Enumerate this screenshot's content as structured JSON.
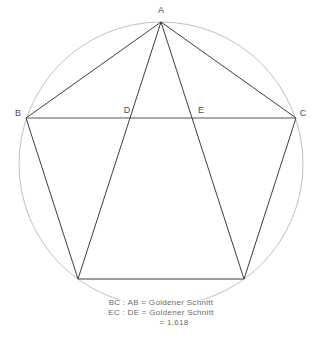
{
  "figure": {
    "type": "geometric-diagram",
    "colors": {
      "background": "#ffffff",
      "circle_stroke": "#b8b8b8",
      "polygon_stroke": "#3f3f3f",
      "chord_stroke": "#555555",
      "label_text": "#4d4d4d",
      "caption_text": "#6a6a6a"
    },
    "circle": {
      "center_x": 161,
      "center_y": 164,
      "radius": 142
    },
    "points": [
      {
        "id": "A",
        "label": "A",
        "x": 161,
        "y": 22,
        "label_x": 161,
        "label_y": 13
      },
      {
        "id": "B",
        "label": "B",
        "x": 26,
        "y": 118,
        "label_x": 18,
        "label_y": 116
      },
      {
        "id": "C",
        "label": "C",
        "x": 296,
        "y": 118,
        "label_x": 303,
        "label_y": 116
      },
      {
        "id": "D",
        "label": "D",
        "x": 135,
        "y": 118,
        "label_x": 127,
        "label_y": 113
      },
      {
        "id": "E",
        "label": "E",
        "x": 196,
        "y": 118,
        "label_x": 201,
        "label_y": 113
      },
      {
        "id": "F",
        "label": "",
        "x": 78,
        "y": 279,
        "label_x": 0,
        "label_y": 0
      },
      {
        "id": "G",
        "label": "",
        "x": 244,
        "y": 279,
        "label_x": 0,
        "label_y": 0
      }
    ],
    "pentagon_path": "M161,22 L296,118 L244,279 L78,279 L26,118 Z",
    "segments": [
      {
        "name": "chord-BC",
        "x1": 26,
        "y1": 118,
        "x2": 296,
        "y2": 118
      },
      {
        "name": "diagonal-A-to-bottom-left",
        "x1": 161,
        "y1": 22,
        "x2": 78,
        "y2": 279
      },
      {
        "name": "diagonal-A-to-bottom-right",
        "x1": 161,
        "y1": 22,
        "x2": 244,
        "y2": 279
      }
    ]
  },
  "caption": {
    "line1": "BC : AB = Goldener Schnitt",
    "line2": "EC : DE = Goldener Schnitt",
    "line3": "= 1,618"
  }
}
